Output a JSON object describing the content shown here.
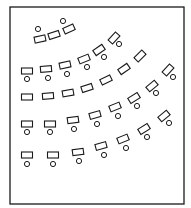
{
  "diagram": {
    "type": "classroom-seating-layout",
    "colors": {
      "stroke": "#1a1a1a",
      "background": "#ffffff"
    },
    "frame": {
      "x": 10,
      "y": 7,
      "width": 174,
      "height": 197
    },
    "desk_size": {
      "w": 11,
      "h": 6
    },
    "chair_radius": 2.6,
    "groups": [
      {
        "name": "front-group",
        "seats": [
          {
            "desk": [
              40,
              39,
              -12
            ],
            "chair": [
              38,
              29
            ]
          },
          {
            "desk": [
              54,
              35,
              -18
            ],
            "chair": null
          },
          {
            "desk": [
              69,
              29,
              -25
            ],
            "chair": [
              63,
              21
            ]
          }
        ]
      },
      {
        "name": "row-1",
        "seats": [
          {
            "desk": [
              27,
              71,
              0
            ],
            "chair": [
              27,
              79
            ]
          },
          {
            "desk": [
              46,
              69,
              -5
            ],
            "chair": [
              48,
              78
            ]
          },
          {
            "desk": [
              65,
              65,
              -12
            ],
            "chair": [
              67,
              74
            ]
          },
          {
            "desk": [
              84,
              59,
              -22
            ],
            "chair": [
              87,
              67
            ]
          },
          {
            "desk": [
              99,
              50,
              -35
            ],
            "chair": [
              104,
              57
            ]
          },
          {
            "desk": [
              114,
              38,
              -48
            ],
            "chair": [
              119,
              44
            ]
          }
        ]
      },
      {
        "name": "row-2",
        "seats": [
          {
            "desk": [
              27,
              97,
              0
            ],
            "chair": null
          },
          {
            "desk": [
              48,
              96,
              -4
            ],
            "chair": null
          },
          {
            "desk": [
              68,
              93,
              -10
            ],
            "chair": null
          },
          {
            "desk": [
              87,
              88,
              -18
            ],
            "chair": null
          },
          {
            "desk": [
              106,
              80,
              -26
            ],
            "chair": null
          },
          {
            "desk": [
              124,
              69,
              -35
            ],
            "chair": null
          },
          {
            "desk": [
              140,
              56,
              -45
            ],
            "chair": null
          }
        ]
      },
      {
        "name": "row-3",
        "seats": [
          {
            "desk": [
              27,
              124,
              0
            ],
            "chair": [
              27,
              132
            ]
          },
          {
            "desk": [
              50,
              124,
              0
            ],
            "chair": [
              50,
              132
            ]
          },
          {
            "desk": [
              73,
              120,
              -8
            ],
            "chair": [
              74,
              129
            ]
          },
          {
            "desk": [
              95,
              115,
              -15
            ],
            "chair": [
              97,
              124
            ]
          },
          {
            "desk": [
              115,
              107,
              -22
            ],
            "chair": [
              118,
              116
            ]
          },
          {
            "desk": [
              134,
              98,
              -32
            ],
            "chair": [
              137,
              106
            ]
          },
          {
            "desk": [
              152,
              86,
              -40
            ],
            "chair": [
              156,
              93
            ]
          },
          {
            "desk": [
              168,
              70,
              -48
            ],
            "chair": [
              173,
              77
            ]
          }
        ]
      },
      {
        "name": "row-4",
        "seats": [
          {
            "desk": [
              27,
              155,
              0
            ],
            "chair": [
              27,
              164
            ]
          },
          {
            "desk": [
              53,
              155,
              0
            ],
            "chair": [
              53,
              164
            ]
          },
          {
            "desk": [
              78,
              152,
              -8
            ],
            "chair": [
              79,
              161
            ]
          },
          {
            "desk": [
              101,
              146,
              -15
            ],
            "chair": [
              104,
              155
            ]
          },
          {
            "desk": [
              123,
              139,
              -22
            ],
            "chair": [
              126,
              148
            ]
          },
          {
            "desk": [
              144,
              129,
              -32
            ],
            "chair": [
              147,
              137
            ]
          },
          {
            "desk": [
              164,
              116,
              -40
            ],
            "chair": [
              169,
              123
            ]
          }
        ]
      }
    ]
  }
}
